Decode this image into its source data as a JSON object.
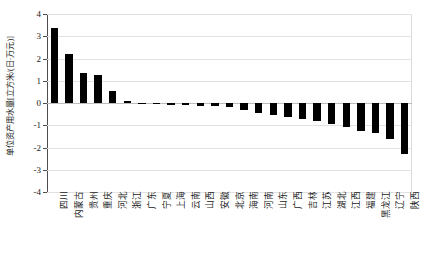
{
  "chart_data": {
    "type": "bar",
    "title": "",
    "subtitle": "",
    "xlabel": "",
    "ylabel": "单位资产用水量[立方米/(日·万元)]",
    "ylim": [
      -4,
      4
    ],
    "yticks": [
      4,
      3,
      2,
      1,
      0,
      -1,
      -2,
      -3,
      -4
    ],
    "ytick_labels": [
      "4",
      "3",
      "2",
      "1",
      "0",
      "-1",
      "-2",
      "-3",
      "-4"
    ],
    "grid": true,
    "legend": false,
    "legend_position": "none",
    "bar_color": "#000000",
    "categories": [
      "四川",
      "内蒙古",
      "贵州",
      "重庆",
      "河北",
      "浙江",
      "广东",
      "宁夏",
      "上海",
      "云南",
      "山西",
      "安徽",
      "北京",
      "海南",
      "河南",
      "山东",
      "广西",
      "吉林",
      "江苏",
      "湖北",
      "江西",
      "福建",
      "黑龙江",
      "辽宁",
      "陕西"
    ],
    "values": [
      3.35,
      2.2,
      1.35,
      1.25,
      0.55,
      0.1,
      -0.03,
      -0.05,
      -0.07,
      -0.1,
      -0.12,
      -0.15,
      -0.2,
      -0.3,
      -0.45,
      -0.55,
      -0.65,
      -0.72,
      -0.8,
      -0.95,
      -1.1,
      -1.25,
      -1.35,
      -1.6,
      -2.3
    ]
  },
  "axis": {
    "ylabel": "单位资产用水量[立方米/(日·万元)]"
  }
}
